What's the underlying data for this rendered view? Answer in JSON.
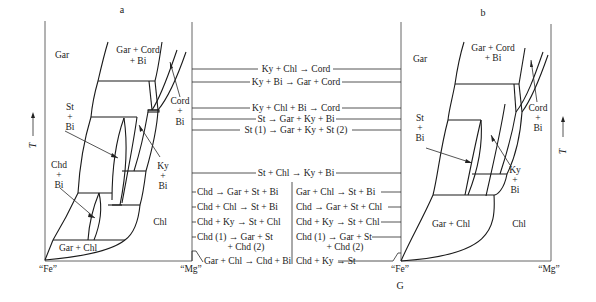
{
  "panels": {
    "a": {
      "label": "a",
      "axis_y": "T",
      "x_left": "“Fe”",
      "x_right": "“Mg”",
      "fields": {
        "gar": "Gar",
        "gar_cord_bi_1": "Gar + Cord",
        "gar_cord_bi_2": "+ Bi",
        "cord_bi_1": "Cord",
        "cord_bi_2": "+",
        "cord_bi_3": "Bi",
        "st_bi_1": "St",
        "st_bi_2": "+",
        "st_bi_3": "Bi",
        "chd_bi_1": "Chd",
        "chd_bi_2": "+",
        "chd_bi_3": "Bi",
        "ky_bi_1": "Ky",
        "ky_bi_2": "+",
        "ky_bi_3": "Bi",
        "chl": "Chl",
        "gar_chl": "Gar + Chl"
      }
    },
    "b": {
      "label": "b",
      "axis_y": "T",
      "x_left": "“Fe”",
      "x_right": "“Mg”",
      "fields": {
        "gar": "Gar",
        "gar_cord_bi_1": "Gar + Cord",
        "gar_cord_bi_2": "+ Bi",
        "cord_bi_1": "Cord",
        "cord_bi_2": "+",
        "cord_bi_3": "Bi",
        "st_bi_1": "St",
        "st_bi_2": "+",
        "st_bi_3": "Bi",
        "ky_bi_1": "Ky",
        "ky_bi_2": "+",
        "ky_bi_3": "Bi",
        "chl": "Chl",
        "gar_chl": "Gar + Chl"
      }
    }
  },
  "center": {
    "bottom_label": "G",
    "shared_reactions": [
      "Ky + Chl → Cord",
      "Ky + Bi → Gar + Cord",
      "Ky + Chl + Bi → Cord",
      "St → Gar + Ky + Bi",
      "St (1) → Gar + Ky + St (2)",
      "St + Chl → Ky + Bi"
    ],
    "left_column": [
      "Chd → Gar + St + Bi",
      "Chd + Chl → St + Bi",
      "Chd + Ky → St + Chl",
      "Chd (1) → Gar + St",
      "+ Chd (2)",
      "Gar + Chl → Chd + Bi"
    ],
    "right_column": [
      "Gar + Chl → St + Bi",
      "Chd → Gar + St + Chl",
      "Chd + Ky → St + Chl",
      "Chd (1) → Gar + St",
      "+ Chd (2)",
      "Chd + Ky → St"
    ]
  }
}
